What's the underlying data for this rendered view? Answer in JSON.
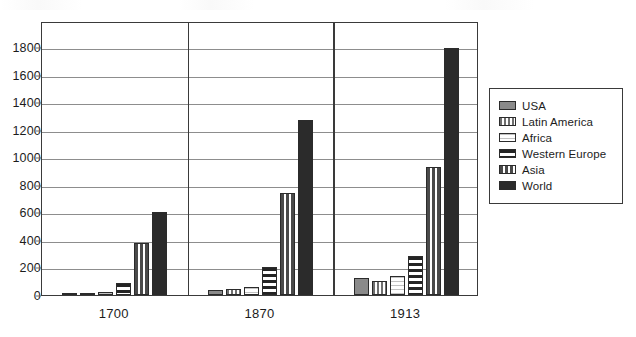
{
  "chart_data": {
    "type": "bar",
    "title": "",
    "xlabel": "",
    "ylabel": "",
    "categories": [
      "1700",
      "1870",
      "1913"
    ],
    "ylim": [
      0,
      1800
    ],
    "yticks": [
      0,
      200,
      400,
      600,
      800,
      1000,
      1200,
      1400,
      1600,
      1800
    ],
    "ytick_labels": [
      "0",
      "200",
      "400",
      "600",
      "800",
      "1000",
      "1200",
      "1400",
      "1600",
      "1800"
    ],
    "grid": true,
    "legend_position": "right",
    "series": [
      {
        "name": "USA",
        "pattern": "solid-gray",
        "values": [
          5,
          40,
          120
        ]
      },
      {
        "name": "Latin America",
        "pattern": "vstripe",
        "values": [
          15,
          45,
          100
        ]
      },
      {
        "name": "Africa",
        "pattern": "light-hline",
        "values": [
          25,
          60,
          135
        ]
      },
      {
        "name": "Western Europe",
        "pattern": "bold-hline",
        "values": [
          90,
          200,
          280
        ]
      },
      {
        "name": "Asia",
        "pattern": "dense-vstripe",
        "values": [
          380,
          740,
          930
        ]
      },
      {
        "name": "World",
        "pattern": "solid-black",
        "values": [
          600,
          1270,
          1790
        ]
      }
    ]
  },
  "legend": {
    "entries": [
      {
        "label": "USA"
      },
      {
        "label": "Latin America"
      },
      {
        "label": "Africa"
      },
      {
        "label": "Western Europe"
      },
      {
        "label": "Asia"
      },
      {
        "label": "World"
      }
    ]
  },
  "colors": {
    "frame": "#3a3a3a",
    "gridline": "#8d8d8d",
    "bar_outline": "#2b2b2b",
    "text": "#1c1c1c",
    "background": "#ffffff"
  }
}
